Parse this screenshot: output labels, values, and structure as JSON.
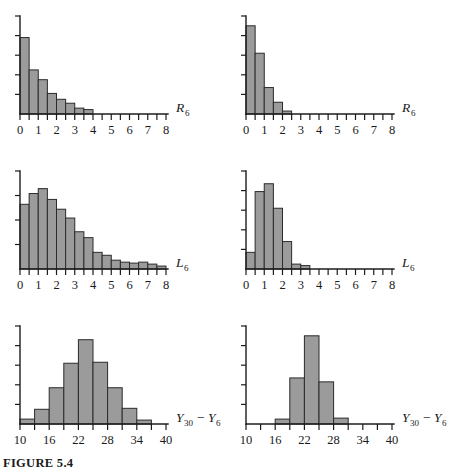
{
  "figure": {
    "caption": "FIGURE 5.4",
    "bar_fill_color": "#9b9b9b",
    "bar_stroke_color": "#2b2b2b",
    "axis_color": "#1c1c1c"
  },
  "chart_data": [
    {
      "id": "top-left",
      "type": "bar",
      "title": "",
      "xlabel": "R_6",
      "xlabel_base": "R",
      "xlabel_sub": "6",
      "ylabel": "",
      "grid": false,
      "legend": "none",
      "xlim": [
        0,
        8
      ],
      "ylim": [
        0,
        1.0
      ],
      "xticks": [
        0,
        1,
        2,
        3,
        4,
        5,
        6,
        7,
        8
      ],
      "xtick_labels": [
        "0",
        "1",
        "2",
        "3",
        "4",
        "5",
        "6",
        "7",
        "8"
      ],
      "yticks": [
        0,
        0.2,
        0.4,
        0.6,
        0.8,
        1.0
      ],
      "bin_width": 0.5,
      "bin_starts": [
        0,
        0.5,
        1.0,
        1.5,
        2.0,
        2.5,
        3.0,
        3.5
      ],
      "values": [
        0.78,
        0.45,
        0.35,
        0.21,
        0.15,
        0.11,
        0.06,
        0.045
      ]
    },
    {
      "id": "top-right",
      "type": "bar",
      "title": "",
      "xlabel": "R_6",
      "xlabel_base": "R",
      "xlabel_sub": "6",
      "ylabel": "",
      "grid": false,
      "legend": "none",
      "xlim": [
        0,
        8
      ],
      "ylim": [
        0,
        1.0
      ],
      "xticks": [
        0,
        1,
        2,
        3,
        4,
        5,
        6,
        7,
        8
      ],
      "xtick_labels": [
        "0",
        "1",
        "2",
        "3",
        "4",
        "5",
        "6",
        "7",
        "8"
      ],
      "yticks": [
        0,
        0.2,
        0.4,
        0.6,
        0.8,
        1.0
      ],
      "bin_width": 0.5,
      "bin_starts": [
        0,
        0.5,
        1.0,
        1.5,
        2.0
      ],
      "values": [
        0.9,
        0.62,
        0.27,
        0.12,
        0.03
      ]
    },
    {
      "id": "middle-left",
      "type": "bar",
      "title": "",
      "xlabel": "L_6",
      "xlabel_base": "L",
      "xlabel_sub": "6",
      "ylabel": "",
      "grid": false,
      "legend": "none",
      "xlim": [
        0,
        8
      ],
      "ylim": [
        0,
        1.0
      ],
      "xticks": [
        0,
        1,
        2,
        3,
        4,
        5,
        6,
        7,
        8
      ],
      "xtick_labels": [
        "0",
        "1",
        "2",
        "3",
        "4",
        "5",
        "6",
        "7",
        "8"
      ],
      "yticks": [
        0,
        0.25,
        0.5,
        0.75,
        1.0
      ],
      "bin_width": 0.5,
      "bin_starts": [
        0,
        0.5,
        1.0,
        1.5,
        2.0,
        2.5,
        3.0,
        3.5,
        4.0,
        4.5,
        5.0,
        5.5,
        6.0,
        6.5,
        7.0,
        7.5
      ],
      "values": [
        0.66,
        0.77,
        0.82,
        0.71,
        0.61,
        0.52,
        0.38,
        0.32,
        0.17,
        0.14,
        0.09,
        0.07,
        0.06,
        0.07,
        0.05,
        0.03
      ]
    },
    {
      "id": "middle-right",
      "type": "bar",
      "title": "",
      "xlabel": "L_6",
      "xlabel_base": "L",
      "xlabel_sub": "6",
      "ylabel": "",
      "grid": false,
      "legend": "none",
      "xlim": [
        0,
        8
      ],
      "ylim": [
        0,
        1.0
      ],
      "xticks": [
        0,
        1,
        2,
        3,
        4,
        5,
        6,
        7,
        8
      ],
      "xtick_labels": [
        "0",
        "1",
        "2",
        "3",
        "4",
        "5",
        "6",
        "7",
        "8"
      ],
      "yticks": [
        0,
        0.2,
        0.4,
        0.6,
        0.8,
        1.0
      ],
      "bin_width": 0.5,
      "bin_starts": [
        0,
        0.5,
        1.0,
        1.5,
        2.0,
        2.5,
        3.0
      ],
      "values": [
        0.17,
        0.79,
        0.87,
        0.62,
        0.28,
        0.05,
        0.035
      ]
    },
    {
      "id": "bottom-left",
      "type": "bar",
      "title": "",
      "xlabel": "Y_30 - Y_6",
      "xlabel_base": "Y",
      "xlabel_sub": "30",
      "xlabel_op": "−",
      "xlabel_base2": "Y",
      "xlabel_sub2": "6",
      "ylabel": "",
      "grid": false,
      "legend": "none",
      "xlim": [
        10,
        40
      ],
      "ylim": [
        0,
        1.0
      ],
      "xticks": [
        10,
        16,
        22,
        28,
        34,
        40
      ],
      "xtick_labels": [
        "10",
        "16",
        "22",
        "28",
        "34",
        "40"
      ],
      "yticks": [
        0,
        0.2,
        0.4,
        0.6,
        0.8,
        1.0
      ],
      "bin_width": 3,
      "bin_starts": [
        10,
        13,
        16,
        19,
        22,
        25,
        28,
        31,
        34
      ],
      "values": [
        0.05,
        0.15,
        0.37,
        0.62,
        0.86,
        0.63,
        0.37,
        0.16,
        0.04
      ]
    },
    {
      "id": "bottom-right",
      "type": "bar",
      "title": "",
      "xlabel": "Y_30 - Y_6",
      "xlabel_base": "Y",
      "xlabel_sub": "30",
      "xlabel_op": "−",
      "xlabel_base2": "Y",
      "xlabel_sub2": "6",
      "ylabel": "",
      "grid": false,
      "legend": "none",
      "xlim": [
        10,
        40
      ],
      "ylim": [
        0,
        1.0
      ],
      "xticks": [
        10,
        16,
        22,
        28,
        34,
        40
      ],
      "xtick_labels": [
        "10",
        "16",
        "22",
        "28",
        "34",
        "40"
      ],
      "yticks": [
        0,
        0.2,
        0.4,
        0.6,
        0.8,
        1.0
      ],
      "bin_width": 3,
      "bin_starts": [
        16,
        19,
        22,
        25,
        28
      ],
      "values": [
        0.05,
        0.47,
        0.9,
        0.43,
        0.06
      ]
    }
  ]
}
